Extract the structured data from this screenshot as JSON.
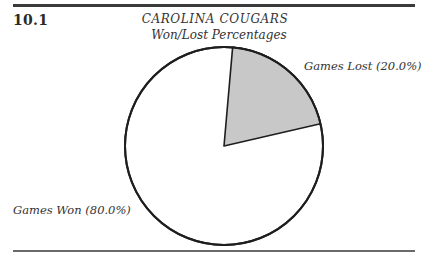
{
  "figure": {
    "number": "10.1",
    "title_line1": "CAROLINA COUGARS",
    "title_line2": "Won/Lost Percentages"
  },
  "labels": {
    "lost": "Games Lost (20.0%)",
    "won": "Games Won (80.0%)"
  },
  "colors": {
    "lost_fill": "#c8c8c8",
    "won_fill": "#ffffff",
    "outline": "#1e1e1e"
  },
  "chart_data": {
    "type": "pie",
    "title": "CAROLINA COUGARS",
    "subtitle": "Won/Lost Percentages",
    "figure_number": "10.1",
    "categories": [
      "Games Lost",
      "Games Won"
    ],
    "values": [
      20.0,
      80.0
    ],
    "unit": "%",
    "slice_labels": [
      "Games Lost (20.0%)",
      "Games Won (80.0%)"
    ],
    "slice_colors": [
      "#c8c8c8",
      "#ffffff"
    ],
    "start_angle_deg_clockwise_from_top": 5,
    "legend": "none (labels placed beside slices)"
  }
}
